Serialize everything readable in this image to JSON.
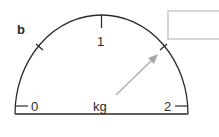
{
  "label": "b",
  "scale": {
    "unit": "kg",
    "ticks": [
      {
        "value": "0",
        "position": "left"
      },
      {
        "value": "1",
        "position": "top"
      },
      {
        "value": "2",
        "position": "right"
      }
    ],
    "min": 0,
    "max": 2
  },
  "answer_box": {
    "value": ""
  },
  "colors": {
    "stroke": "#2a2a2a",
    "arrow": "#a8a8a8",
    "box": "#c8c8c8"
  }
}
